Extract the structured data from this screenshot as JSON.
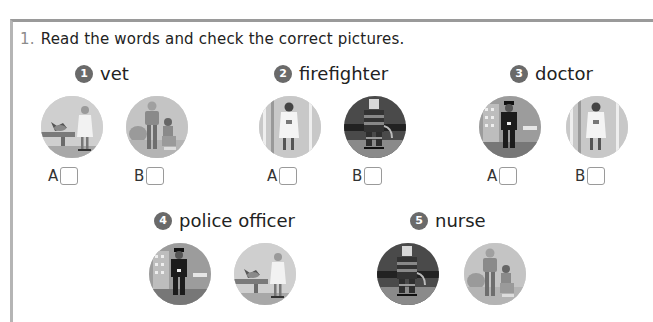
{
  "exercise": {
    "number": "1.",
    "instruction": "Read the words and check the correct pictures."
  },
  "items": [
    {
      "num": "1",
      "word": "vet",
      "options": [
        {
          "letter": "A",
          "picture": "vet-examining-animal",
          "checked": false
        },
        {
          "letter": "B",
          "picture": "nurse-with-patient",
          "checked": false
        }
      ]
    },
    {
      "num": "2",
      "word": "firefighter",
      "options": [
        {
          "letter": "A",
          "picture": "doctor",
          "checked": false
        },
        {
          "letter": "B",
          "picture": "firefighter",
          "checked": false
        }
      ]
    },
    {
      "num": "3",
      "word": "doctor",
      "options": [
        {
          "letter": "A",
          "picture": "police-officer",
          "checked": false
        },
        {
          "letter": "B",
          "picture": "doctor",
          "checked": false
        }
      ]
    },
    {
      "num": "4",
      "word": "police officer",
      "options": [
        {
          "picture": "police-officer"
        },
        {
          "picture": "vet-examining-animal"
        }
      ]
    },
    {
      "num": "5",
      "word": "nurse",
      "options": [
        {
          "picture": "firefighter"
        },
        {
          "picture": "nurse-with-patient"
        }
      ]
    }
  ],
  "colors": {
    "badge": "#6a6a6a",
    "border": "#9a9a9a",
    "text": "#222222"
  }
}
